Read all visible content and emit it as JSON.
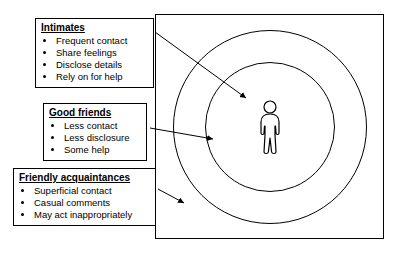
{
  "diagram": {
    "groups": [
      {
        "id": "intimates",
        "title": "Intimates",
        "items": [
          "Frequent contact",
          "Share feelings",
          "Disclose details",
          "Rely on for help"
        ]
      },
      {
        "id": "good-friends",
        "title": "Good friends",
        "items": [
          "Less contact",
          "Less disclosure",
          "Some help"
        ]
      },
      {
        "id": "friendly-acquaintances",
        "title": "Friendly acquaintances",
        "items": [
          "Superficial contact",
          "Casual comments",
          "May act inappropriately"
        ]
      }
    ],
    "figure": {
      "person_label": "person-figure",
      "rings": [
        "outer-ring",
        "inner-ring"
      ]
    },
    "colors": {
      "stroke": "#000000",
      "background": "#ffffff",
      "text": "#000000"
    }
  }
}
